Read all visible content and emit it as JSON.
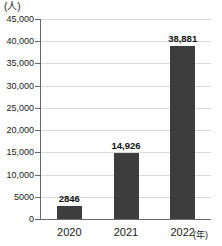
{
  "chart_data": {
    "type": "bar",
    "title": "",
    "xlabel": "(年)",
    "ylabel": "(人)",
    "categories": [
      "2020",
      "2021",
      "2022"
    ],
    "values": [
      2846,
      14926,
      38881
    ],
    "value_labels": [
      "2846",
      "14,926",
      "38,881"
    ],
    "ylim": [
      0,
      45000
    ],
    "ytick_values": [
      0,
      5000,
      10000,
      15000,
      20000,
      25000,
      30000,
      35000,
      40000,
      45000
    ],
    "ytick_labels": [
      "0",
      "5000",
      "10,000",
      "15,000",
      "20,000",
      "25,000",
      "30,000",
      "35,000",
      "40,000",
      "45,000"
    ],
    "grid": true,
    "legend": "none",
    "bar_color": "#3d3d3d",
    "gridline_color": "#d8d8d8",
    "axis_color": "#6a6a6a"
  }
}
